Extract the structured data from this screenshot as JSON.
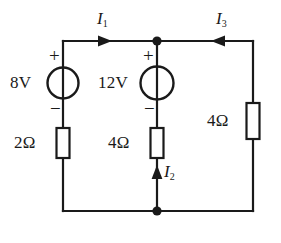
{
  "diagram": {
    "type": "electrical-schematic",
    "background_color": "#ffffff",
    "wire_color": "#1a1a1a",
    "sources": [
      {
        "id": "source-8v",
        "label": "8V",
        "kind": "voltage-source",
        "plus": "+",
        "minus": "−",
        "branch": "left"
      },
      {
        "id": "source-12v",
        "label": "12V",
        "kind": "voltage-source",
        "plus": "+",
        "minus": "−",
        "branch": "middle"
      }
    ],
    "resistors": [
      {
        "id": "resistor-2ohm-left",
        "label": "2Ω",
        "branch": "left",
        "orientation": "vertical"
      },
      {
        "id": "resistor-4ohm-middle",
        "label": "4Ω",
        "branch": "middle",
        "orientation": "vertical"
      },
      {
        "id": "resistor-4ohm-right",
        "label": "4Ω",
        "branch": "right",
        "orientation": "vertical"
      }
    ],
    "currents": [
      {
        "id": "current-i1",
        "symbol": "I",
        "subscript": "1",
        "direction": "right",
        "branch": "top-left"
      },
      {
        "id": "current-i2",
        "symbol": "I",
        "subscript": "2",
        "direction": "up",
        "branch": "middle-bottom"
      },
      {
        "id": "current-i3",
        "symbol": "I",
        "subscript": "3",
        "direction": "left",
        "branch": "top-right"
      }
    ],
    "nodes": [
      {
        "id": "node-top-center",
        "label": ""
      },
      {
        "id": "node-bottom-center",
        "label": ""
      }
    ]
  }
}
